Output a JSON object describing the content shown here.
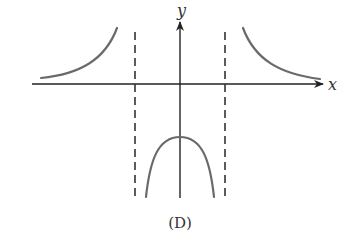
{
  "figure": {
    "caption": "(D)",
    "axes": {
      "x_label": "x",
      "y_label": "y",
      "x_axis": {
        "x1": 32,
        "x2": 323,
        "y": 84
      },
      "y_axis": {
        "x": 180,
        "y1": 198,
        "y2": 22
      }
    },
    "asymptotes": [
      {
        "name": "left-vertical-asymptote",
        "x": 135,
        "y1": 32,
        "y2": 198,
        "style": "dashed"
      },
      {
        "name": "right-vertical-asymptote",
        "x": 225,
        "y1": 32,
        "y2": 198,
        "style": "dashed"
      }
    ],
    "curves": [
      {
        "name": "left-branch",
        "description": "above x-axis, approaches asymptote upward from left",
        "d": "M41 78 C 80 74, 105 60, 117 28"
      },
      {
        "name": "right-branch",
        "description": "above x-axis, approaches asymptote upward from right",
        "d": "M243 28 C 255 60, 280 74, 320 79"
      },
      {
        "name": "middle-branch",
        "description": "downward-opening cap between asymptotes, below x-axis",
        "d": "M146 197 C 150 160, 158 137, 180 137 C 202 137, 210 160, 214 197"
      }
    ],
    "colors": {
      "axis": "#222222",
      "curve": "#6a6a6a",
      "asymptote": "#333333",
      "text": "#333333"
    }
  }
}
